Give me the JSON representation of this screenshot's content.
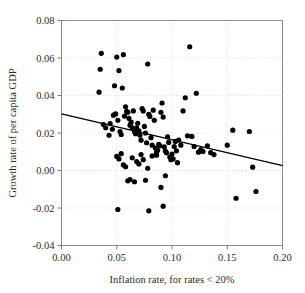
{
  "chart_data": {
    "type": "scatter",
    "title": "",
    "xlabel": "Inflation rate, for rates < 20%",
    "ylabel": "Growth rate of per capita GDP",
    "xlim": [
      0.0,
      0.2
    ],
    "ylim": [
      -0.04,
      0.08
    ],
    "xticks": [
      0.0,
      0.05,
      0.1,
      0.15,
      0.2
    ],
    "xticklabels": [
      "0.00",
      "0.05",
      "0.10",
      "0.15",
      "0.20"
    ],
    "yticks": [
      -0.04,
      -0.02,
      0.0,
      0.02,
      0.04,
      0.06,
      0.08
    ],
    "yticklabels": [
      "-0.04",
      "-0.02",
      "0.00",
      "0.02",
      "0.04",
      "0.06",
      "0.08"
    ],
    "grid": true,
    "grid_style": "dotted",
    "legend": "none",
    "marker": "filled-circle",
    "marker_color": "#000000",
    "marker_size_px": 2.6,
    "series": [
      {
        "name": "countries",
        "x": [
          0.036,
          0.035,
          0.034,
          0.048,
          0.05,
          0.052,
          0.055,
          0.056,
          0.058,
          0.06,
          0.044,
          0.046,
          0.043,
          0.04,
          0.038,
          0.047,
          0.049,
          0.051,
          0.053,
          0.054,
          0.057,
          0.059,
          0.061,
          0.062,
          0.063,
          0.064,
          0.065,
          0.066,
          0.067,
          0.068,
          0.069,
          0.07,
          0.071,
          0.072,
          0.073,
          0.074,
          0.075,
          0.076,
          0.077,
          0.078,
          0.079,
          0.08,
          0.081,
          0.082,
          0.083,
          0.084,
          0.085,
          0.086,
          0.087,
          0.088,
          0.089,
          0.09,
          0.091,
          0.092,
          0.093,
          0.094,
          0.095,
          0.096,
          0.097,
          0.098,
          0.099,
          0.1,
          0.101,
          0.102,
          0.103,
          0.104,
          0.105,
          0.106,
          0.108,
          0.11,
          0.112,
          0.114,
          0.116,
          0.118,
          0.12,
          0.122,
          0.124,
          0.126,
          0.128,
          0.132,
          0.135,
          0.138,
          0.05,
          0.052,
          0.054,
          0.056,
          0.058,
          0.06,
          0.062,
          0.064,
          0.066,
          0.068,
          0.07,
          0.072,
          0.074,
          0.076,
          0.078,
          0.082,
          0.086,
          0.09,
          0.092,
          0.094,
          0.155,
          0.158,
          0.17,
          0.173,
          0.176,
          0.15
        ],
        "y": [
          0.0625,
          0.054,
          0.0418,
          0.0452,
          0.0605,
          0.0533,
          0.044,
          0.0618,
          0.034,
          0.031,
          0.025,
          0.022,
          0.0188,
          0.0228,
          0.0245,
          0.0295,
          0.0302,
          0.0268,
          0.0208,
          0.0192,
          0.029,
          0.0315,
          0.0278,
          0.0242,
          0.0258,
          0.0228,
          0.0318,
          0.0208,
          0.0196,
          0.0228,
          0.0252,
          0.0212,
          0.0188,
          0.0162,
          0.033,
          0.0318,
          0.0235,
          0.02,
          0.0148,
          0.0568,
          0.03,
          0.0288,
          0.0175,
          0.0135,
          0.0322,
          0.0268,
          0.012,
          0.0098,
          0.0108,
          0.014,
          0.0132,
          0.031,
          0.036,
          0.0285,
          0.0126,
          0.0104,
          0.0095,
          0.018,
          0.015,
          0.0072,
          0.0058,
          0.0088,
          0.0062,
          0.0128,
          0.0155,
          0.0105,
          0.0042,
          0.0162,
          0.0135,
          0.0318,
          0.0388,
          0.0185,
          0.066,
          0.0182,
          0.0128,
          0.0412,
          0.0098,
          0.0112,
          0.0102,
          0.0132,
          0.0095,
          0.0085,
          0.0075,
          0.0062,
          0.009,
          0.003,
          0.002,
          -0.0055,
          -0.0048,
          0.0068,
          -0.006,
          0.0048,
          0.0035,
          0.0085,
          0.0058,
          -0.0052,
          0.0012,
          0.0078,
          0.0082,
          -0.009,
          -0.019,
          -0.0028,
          0.0215,
          -0.0148,
          0.0208,
          0.0018,
          -0.0112,
          0.0135
        ],
        "color": "#000000"
      }
    ],
    "trendline": {
      "type": "linear-fit",
      "x_start": 0.0,
      "y_start": 0.0302,
      "x_end": 0.2,
      "y_end": 0.0026,
      "color": "#000000"
    },
    "extra_points": [
      {
        "x": 0.051,
        "y": -0.0208
      },
      {
        "x": 0.079,
        "y": -0.0215
      }
    ]
  }
}
